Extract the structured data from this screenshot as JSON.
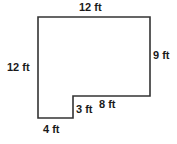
{
  "figure": {
    "type": "l-shaped-polygon",
    "stroke_color": "#333333",
    "fill_color": "#ffffff",
    "background_color": "#ffffff",
    "unit": "ft",
    "vertices": [
      {
        "name": "top-left",
        "x": 38,
        "y": 17
      },
      {
        "name": "top-right",
        "x": 150,
        "y": 17
      },
      {
        "name": "bottom-right",
        "x": 150,
        "y": 96
      },
      {
        "name": "notch-corner",
        "x": 73,
        "y": 96
      },
      {
        "name": "notch-bottom",
        "x": 73,
        "y": 118
      },
      {
        "name": "bottom-left",
        "x": 38,
        "y": 118
      }
    ],
    "labels": {
      "top": "12 ft",
      "left": "12 ft",
      "right": "9 ft",
      "notch_horizontal": "8 ft",
      "notch_vertical": "3 ft",
      "bottom": "4 ft"
    },
    "measurements": [
      {
        "side": "top",
        "value": 12,
        "unit": "ft"
      },
      {
        "side": "left",
        "value": 12,
        "unit": "ft"
      },
      {
        "side": "right",
        "value": 9,
        "unit": "ft"
      },
      {
        "side": "notch_horizontal",
        "value": 8,
        "unit": "ft"
      },
      {
        "side": "notch_vertical",
        "value": 3,
        "unit": "ft"
      },
      {
        "side": "bottom",
        "value": 4,
        "unit": "ft"
      }
    ]
  }
}
